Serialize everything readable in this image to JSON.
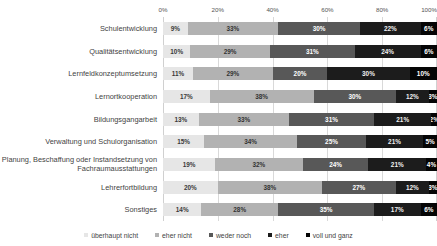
{
  "chart_data": {
    "type": "bar",
    "orientation": "horizontal",
    "stacked": true,
    "stack_mode": "percent",
    "title": "",
    "xlabel": "",
    "ylabel": "",
    "xlim": [
      0,
      100
    ],
    "xticks": [
      "0%",
      "20%",
      "40%",
      "60%",
      "80%",
      "100%"
    ],
    "xtick_values": [
      0,
      20,
      40,
      60,
      80,
      100
    ],
    "grid": true,
    "grid_axis": "x",
    "legend_position": "bottom",
    "value_suffix": "%",
    "categories": [
      "Schulentwicklung",
      "Qualitätsentwicklung",
      "Lernfeldkonzeptumsetzung",
      "Lernortkooperation",
      "Bildungsgangarbeit",
      "Verwaltung und Schulorganisation",
      "Planung, Beschaffung oder Instandsetzung von Fachraumausstattungen",
      "Lehrerfortbildung",
      "Sonstiges"
    ],
    "series": [
      {
        "name": "überhaupt nicht",
        "color": "#e6e6e6",
        "values": [
          9,
          10,
          11,
          17,
          13,
          15,
          19,
          20,
          14
        ]
      },
      {
        "name": "eher nicht",
        "color": "#b2b2b2",
        "values": [
          33,
          29,
          29,
          38,
          33,
          34,
          32,
          38,
          28
        ]
      },
      {
        "name": "weder noch",
        "color": "#585858",
        "values": [
          30,
          31,
          20,
          30,
          31,
          25,
          24,
          27,
          35
        ]
      },
      {
        "name": "eher",
        "color": "#1c1c1c",
        "values": [
          22,
          24,
          30,
          12,
          21,
          21,
          21,
          12,
          17
        ]
      },
      {
        "name": "voll und ganz",
        "color": "#050505",
        "values": [
          6,
          6,
          10,
          3,
          2,
          5,
          4,
          3,
          6
        ]
      }
    ]
  }
}
